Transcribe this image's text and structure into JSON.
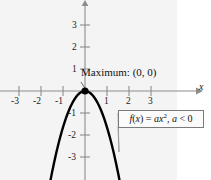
{
  "figure": {
    "background_color": "#f4f4f4",
    "page_color": "#ffffff",
    "curve_color": "#000000",
    "axis_color": "#8c8c8c"
  },
  "annotations": {
    "maximum_label": "Maximum: (0, 0)",
    "formula_prefix": "f",
    "formula_open": "(",
    "formula_var": "x",
    "formula_close": ")",
    "formula_equals": " = ",
    "formula_a": "a",
    "formula_x": "x",
    "formula_exponent": "2",
    "formula_comma": ", ",
    "formula_a2": "a",
    "formula_ineq": " < 0",
    "formula_full": "f(x) = ax2, a < 0"
  },
  "axes": {
    "x_label": "x",
    "x_ticks": [
      "-3",
      "-2",
      "-1",
      "1",
      "2",
      "3"
    ],
    "y_ticks": [
      "3",
      "2",
      "1",
      "-1",
      "-2",
      "-3"
    ]
  },
  "chart_data": {
    "type": "line",
    "title": "",
    "subtitle": "",
    "xlabel": "x",
    "ylabel": "",
    "xlim": [
      -3.9,
      4.0
    ],
    "ylim": [
      -3.6,
      3.6
    ],
    "xticks": [
      -3,
      -2,
      -1,
      1,
      2,
      3
    ],
    "yticks": [
      3,
      2,
      1,
      -1,
      -2,
      -3
    ],
    "grid": false,
    "legend": false,
    "equation": "f(x) = a*x^2, a < 0",
    "coefficient_a": -1.65,
    "vertex": [
      0,
      0
    ],
    "vertex_label": "Maximum: (0, 0)",
    "annotations": [
      {
        "text": "Maximum: (0, 0)",
        "target": [
          0,
          0
        ]
      },
      {
        "text": "f(x) = ax2, a < 0",
        "target": [
          1.55,
          -3.0
        ]
      }
    ],
    "series": [
      {
        "name": "f(x) = ax^2, a < 0",
        "color": "#000000",
        "x": [
          -1.48,
          -1.35,
          -1.2,
          -1.05,
          -0.9,
          -0.75,
          -0.6,
          -0.45,
          -0.3,
          -0.15,
          0,
          0.15,
          0.3,
          0.45,
          0.6,
          0.75,
          0.9,
          1.05,
          1.2,
          1.35,
          1.48
        ],
        "values": [
          -3.61,
          -3.0,
          -2.38,
          -1.82,
          -1.34,
          -0.93,
          -0.59,
          -0.33,
          -0.15,
          -0.04,
          0,
          -0.04,
          -0.15,
          -0.33,
          -0.59,
          -0.93,
          -1.34,
          -1.82,
          -2.38,
          -3.0,
          -3.61
        ]
      }
    ]
  }
}
